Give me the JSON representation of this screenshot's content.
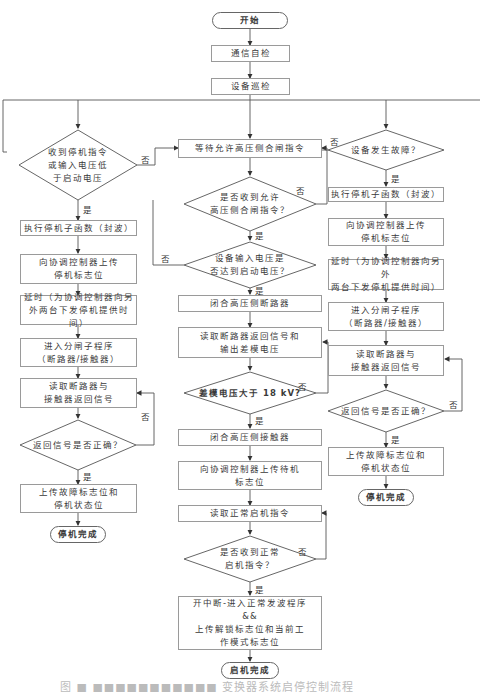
{
  "flowchart": {
    "start": "开始",
    "comm_check": "通信自检",
    "device_patrol": "设备巡检",
    "left": {
      "decision": "收到停机指令\n或输入电压低\n于启动电压",
      "exec_stop": "执行停机子函数（封波）",
      "upload_stop_flag": "向协调控制器上传\n停机标志位",
      "delay": "延时（为协调控制器向另\n外两台下发停机提供时间）",
      "open_sub": "进入分闸子程序\n（断路器/接触器）",
      "read_return": "读取断路器与\n接触器返回信号",
      "check_return": "返回信号是否正确？",
      "upload_fault": "上传故障标志位和\n停机状态位",
      "end": "停机完成"
    },
    "middle": {
      "wait_close": "等待允许高压侧合闸指令",
      "received_close": "是否收到允许\n高压侧合闸指令？",
      "voltage_ok": "设备输入电压是\n否达到启动电压？",
      "close_breaker": "闭合高压侧断路器",
      "read_breaker": "读取断路器返回信号和\n输出差模电压",
      "diff_voltage": "差模电压大于 18 kV?",
      "close_contactor": "闭合高压侧接触器",
      "upload_standby": "向协调控制器上传待机\n标志位",
      "read_start": "读取正常启机指令",
      "received_start": "是否收到正常\n启机指令？",
      "start_program": "开中断-进入正常发波程序\n&&\n上传解锁标志位和当前工\n作模式标志位",
      "end": "启机完成"
    },
    "right": {
      "decision": "设备发生故障？",
      "exec_stop": "执行停机子函数（封波）",
      "upload_stop_flag": "向协调控制器上传\n停机标志位",
      "delay": "延时（为协调控制器向另外\n两台下发停机提供时间）",
      "open_sub": "进入分闸子程序\n（断路器/接触器）",
      "read_return": "读取断路器与\n接触器返回信号",
      "check_return": "返回信号是否正确？",
      "upload_fault": "上传故障标志位和\n停机状态位",
      "end": "停机完成"
    },
    "labels": {
      "yes": "是",
      "no": "否"
    }
  },
  "caption": "图 ■ ■■■■■■■■■■■ 变换器系统启停控制流程"
}
